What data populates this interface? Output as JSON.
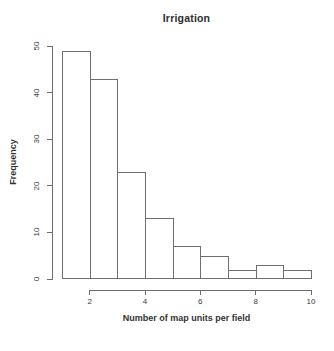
{
  "chart_data": {
    "type": "bar",
    "subtype": "histogram",
    "title": "Irrigation",
    "xlabel": "Number of map units per field",
    "ylabel": "Frequency",
    "bin_edges": [
      1,
      2,
      3,
      4,
      5,
      6,
      7,
      8,
      9,
      10
    ],
    "frequencies": [
      49,
      43,
      23,
      13,
      7,
      5,
      2,
      3,
      2
    ],
    "x_ticks": [
      2,
      4,
      6,
      8,
      10
    ],
    "y_ticks": [
      0,
      10,
      20,
      30,
      40,
      50
    ],
    "xlim": [
      1,
      10
    ],
    "ylim": [
      0,
      50
    ],
    "grid": "off",
    "legend": "none",
    "colors": {
      "background": "#ffffff",
      "bar_fill": "#ffffff",
      "bar_border": "#6f6f6f",
      "axis_line": "#6f6f6f",
      "text": "#333333"
    }
  }
}
